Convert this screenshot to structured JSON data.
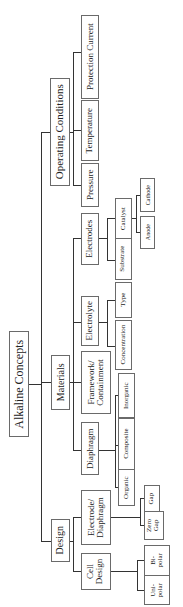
{
  "diagram": {
    "orientation": "rotated 90deg counter-clockwise",
    "root": "Alkaline Concepts",
    "categories": {
      "operating_conditions": {
        "label": "Operating Conditions",
        "children": [
          "Pressure",
          "Temperature",
          "Protection Current"
        ]
      },
      "materials": {
        "label": "Materials",
        "electrodes": {
          "label": "Electrodes",
          "substrate": "Substrate",
          "catalyst": "Catalyst",
          "anode": "Anode",
          "cathode": "Cathode"
        },
        "electrolyte": {
          "label": "Electrolyte",
          "concentration": "Concentration",
          "type": "Type"
        },
        "framework": {
          "label_line1": "Framework/",
          "label_line2": "Containment"
        },
        "diaphragm": {
          "label": "Diaphragm",
          "organic": "Organic",
          "composite": "Composite",
          "inorganic": "Inorganic"
        }
      },
      "design": {
        "label": "Design",
        "electrode_diaphragm": {
          "label_line1": "Electrode/",
          "label_line2": "Diaphragm",
          "zero_gap_line1": "Zero",
          "zero_gap_line2": "Gap",
          "gap": "Gap"
        },
        "cell_design": {
          "label_line1": "Cell",
          "label_line2": "Design",
          "bipolar_line1": "Bi-",
          "bipolar_line2": "polar",
          "unipolar_line1": "Uni-",
          "unipolar_line2": "polar"
        }
      }
    }
  }
}
